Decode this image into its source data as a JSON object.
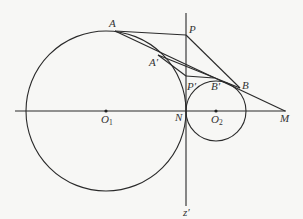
{
  "diagram": {
    "type": "geometry",
    "colors": {
      "stroke": "#2a2a2a",
      "background": "#f7f7f5",
      "label": "#333333"
    },
    "labels": {
      "A": "A",
      "A_prime": "A′",
      "P": "P",
      "P_prime": "P′",
      "B_prime": "B′",
      "B": "B",
      "N": "N",
      "O1": "O",
      "O1_sub": "1",
      "O2": "O",
      "O2_sub": "2",
      "M": "M",
      "z_prime": "z′"
    },
    "circles": [
      {
        "name": "O1",
        "cx": 106,
        "cy": 111,
        "r": 80
      },
      {
        "name": "O2",
        "cx": 216,
        "cy": 111,
        "r": 30
      }
    ],
    "points": {
      "A": [
        115,
        30
      ],
      "A_prime": [
        158,
        55
      ],
      "P": [
        186,
        35
      ],
      "P_prime": [
        186,
        76
      ],
      "B_prime": [
        214,
        78
      ],
      "B": [
        240,
        88
      ],
      "N": [
        186,
        111
      ],
      "M": [
        285,
        111
      ]
    }
  }
}
